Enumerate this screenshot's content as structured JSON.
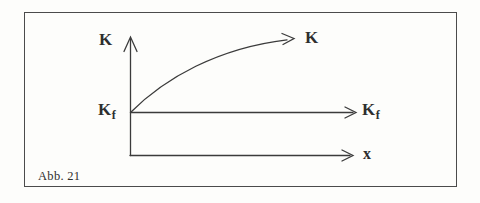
{
  "figure": {
    "caption": "Abb. 21"
  },
  "labels": {
    "y_axis": "K",
    "curve_end": "K",
    "kf_left": {
      "main": "K",
      "sub": "f"
    },
    "kf_right": {
      "main": "K",
      "sub": "f"
    },
    "x_axis": "x"
  },
  "colors": {
    "line": "#3b3b3b",
    "frame": "#4b4b4b",
    "text": "#2e2e2e",
    "background": "#fdfdfb"
  }
}
